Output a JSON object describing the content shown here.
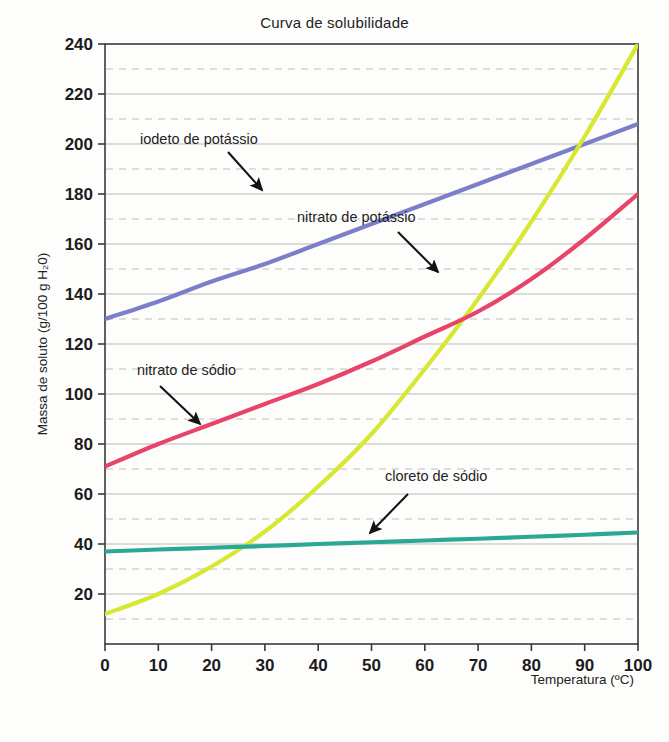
{
  "chart_data": {
    "type": "line",
    "title": "Curva de solubilidade",
    "xlabel": "Temperatura (ºC)",
    "ylabel": "Massa de soluto (g/100 g H₂0)",
    "xlim": [
      0,
      100
    ],
    "ylim": [
      0,
      240
    ],
    "xticks": [
      "0",
      "10",
      "20",
      "30",
      "40",
      "50",
      "60",
      "70",
      "80",
      "90",
      "100"
    ],
    "xtick_values": [
      0,
      10,
      20,
      30,
      40,
      50,
      60,
      70,
      80,
      90,
      100
    ],
    "yticks": [
      "20",
      "40",
      "60",
      "80",
      "100",
      "120",
      "140",
      "160",
      "180",
      "200",
      "220",
      "240"
    ],
    "ytick_values": [
      20,
      40,
      60,
      80,
      100,
      120,
      140,
      160,
      180,
      200,
      220,
      240
    ],
    "minor_ytick_values": [
      10,
      30,
      50,
      70,
      90,
      110,
      130,
      150,
      170,
      190,
      210,
      230
    ],
    "grid": "horizontal-major-solid-minor-dashed",
    "legend_position": "inline-annotations",
    "x": [
      0,
      10,
      20,
      30,
      40,
      50,
      60,
      70,
      80,
      90,
      100
    ],
    "series": [
      {
        "name": "iodeto de potássio",
        "color": "#7b7ec9",
        "values": [
          130,
          137,
          145,
          152,
          160,
          168,
          176,
          184,
          192,
          200,
          208
        ],
        "clipped_at_top": true,
        "label_x": 140,
        "label_y": 144,
        "arrow_from": [
          228,
          152
        ],
        "arrow_to": [
          262,
          190
        ]
      },
      {
        "name": "nitrato de potássio",
        "color": "#d7e732",
        "values": [
          12,
          20,
          31,
          45,
          63,
          84,
          110,
          138,
          169,
          203,
          240
        ],
        "clipped_at_top": false,
        "label_x": 297,
        "label_y": 222,
        "arrow_from": [
          398,
          232
        ],
        "arrow_to": [
          438,
          272
        ]
      },
      {
        "name": "nitrato de sódio",
        "color": "#e8446a",
        "values": [
          71,
          80,
          88,
          96,
          104,
          113,
          123,
          133,
          146,
          162,
          180
        ],
        "clipped_at_top": false,
        "label_x": 137,
        "label_y": 375,
        "arrow_from": [
          160,
          386
        ],
        "arrow_to": [
          200,
          424
        ]
      },
      {
        "name": "cloreto de sódio",
        "color": "#2ba893",
        "values": [
          37,
          37.8,
          38.5,
          39.2,
          40,
          40.7,
          41.4,
          42.1,
          42.9,
          43.7,
          44.6
        ],
        "clipped_at_top": false,
        "label_x": 385,
        "label_y": 481,
        "arrow_from": [
          408,
          494
        ],
        "arrow_to": [
          370,
          533
        ]
      }
    ]
  },
  "plot_geometry": {
    "left": 105,
    "right": 638,
    "top": 44,
    "bottom": 644
  },
  "colors": {
    "axis": "#3a3a3a",
    "major_grid": "#b9b9b9",
    "minor_grid": "#bdbdbd",
    "text": "#1c1c1c",
    "background": "#fdfdfc"
  }
}
